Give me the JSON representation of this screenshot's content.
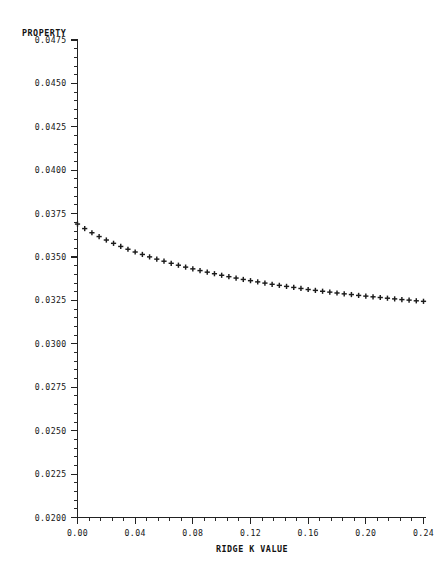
{
  "chart_data": {
    "type": "scatter",
    "title": "PROPERTY",
    "xlabel": "RIDGE K VALUE",
    "ylabel": "PROPERTY",
    "xlim": [
      0.0,
      0.25
    ],
    "ylim": [
      0.02,
      0.0475
    ],
    "grid": false,
    "legend": null,
    "marker": "+",
    "x_ticks": [
      0.0,
      0.04,
      0.08,
      0.12,
      0.16,
      0.2,
      0.24
    ],
    "x_tick_labels": [
      "0.00",
      "0.04",
      "0.08",
      "0.12",
      "0.16",
      "0.20",
      "0.24"
    ],
    "x_minor_per_major": 4,
    "y_ticks": [
      0.02,
      0.0225,
      0.025,
      0.0275,
      0.03,
      0.0325,
      0.035,
      0.0375,
      0.04,
      0.0425,
      0.045,
      0.0475
    ],
    "y_tick_labels": [
      "0.0200",
      "0.0225",
      "0.0250",
      "0.0275",
      "0.0300",
      "0.0325",
      "0.0350",
      "0.0375",
      "0.0400",
      "0.0425",
      "0.0450",
      "0.0475"
    ],
    "y_minor_per_major": 5,
    "series": [
      {
        "name": "ridge trace",
        "x": [
          0.0,
          0.005,
          0.01,
          0.015,
          0.02,
          0.025,
          0.03,
          0.035,
          0.04,
          0.045,
          0.05,
          0.055,
          0.06,
          0.065,
          0.07,
          0.075,
          0.08,
          0.085,
          0.09,
          0.095,
          0.1,
          0.105,
          0.11,
          0.115,
          0.12,
          0.125,
          0.13,
          0.135,
          0.14,
          0.145,
          0.15,
          0.155,
          0.16,
          0.165,
          0.17,
          0.175,
          0.18,
          0.185,
          0.19,
          0.195,
          0.2,
          0.205,
          0.21,
          0.215,
          0.22,
          0.225,
          0.23,
          0.235,
          0.24
        ],
        "y": [
          0.0369,
          0.03664,
          0.0364,
          0.03618,
          0.03598,
          0.03579,
          0.03561,
          0.03545,
          0.03529,
          0.03515,
          0.03501,
          0.03488,
          0.03476,
          0.03464,
          0.03453,
          0.03442,
          0.03432,
          0.03422,
          0.03413,
          0.03404,
          0.03395,
          0.03387,
          0.03379,
          0.03371,
          0.03364,
          0.03357,
          0.0335,
          0.03343,
          0.03337,
          0.03331,
          0.03325,
          0.03319,
          0.03313,
          0.03308,
          0.03303,
          0.03298,
          0.03293,
          0.03288,
          0.03284,
          0.03279,
          0.03275,
          0.03271,
          0.03267,
          0.03263,
          0.03259,
          0.03255,
          0.03252,
          0.03248,
          0.03245
        ]
      }
    ]
  },
  "colors": {
    "axis": "#222222",
    "marker": "#1b1b1b",
    "text": "#151515",
    "background": "#ffffff"
  }
}
